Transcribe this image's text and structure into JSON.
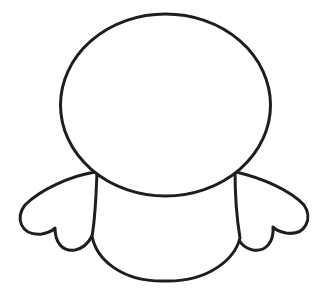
{
  "drawing": {
    "subject": "cartoon character outline (head, body, wings)",
    "colors": {
      "background": "#ffffff",
      "stroke": "#1e1e1e"
    },
    "parts": [
      "head",
      "body",
      "left-wing",
      "right-wing"
    ]
  }
}
